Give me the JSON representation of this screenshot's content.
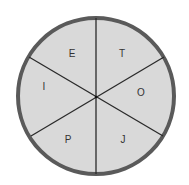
{
  "diagram": {
    "type": "circle-divided-into-sectors",
    "sector_count": 6,
    "colors": {
      "fill": "#d9d9d9",
      "border": "#5a5a5a",
      "divider": "#2a2a2a",
      "text": "#333333"
    },
    "sectors": [
      {
        "position": "top-left",
        "letter": "E"
      },
      {
        "position": "top-right",
        "letter": "T"
      },
      {
        "position": "right",
        "letter": "O"
      },
      {
        "position": "bottom-right",
        "letter": "J"
      },
      {
        "position": "bottom-left",
        "letter": "P"
      },
      {
        "position": "left",
        "letter": "I"
      }
    ]
  }
}
